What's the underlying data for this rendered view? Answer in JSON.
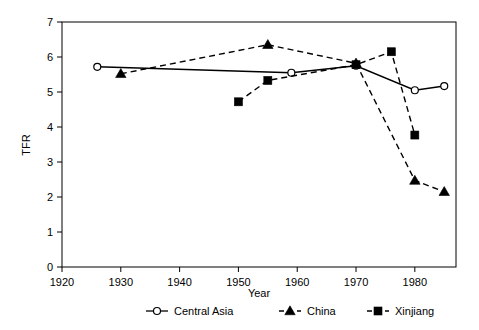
{
  "chart_data": {
    "type": "line",
    "title": "",
    "xlabel": "Year",
    "ylabel": "TFR",
    "xlim": [
      1920,
      1987
    ],
    "ylim": [
      0,
      7
    ],
    "xticks": [
      1920,
      1930,
      1940,
      1950,
      1960,
      1970,
      1980
    ],
    "yticks": [
      0,
      1,
      2,
      3,
      4,
      5,
      6,
      7
    ],
    "grid": false,
    "legend_position": "bottom",
    "series": [
      {
        "name": "Central Asia",
        "marker": "open-circle",
        "linestyle": "solid",
        "color": "#000000",
        "points": [
          {
            "x": 1926,
            "y": 5.72
          },
          {
            "x": 1959,
            "y": 5.55
          },
          {
            "x": 1970,
            "y": 5.75
          },
          {
            "x": 1980,
            "y": 5.05
          },
          {
            "x": 1985,
            "y": 5.17
          }
        ]
      },
      {
        "name": "China",
        "marker": "filled-triangle",
        "linestyle": "dashed",
        "color": "#000000",
        "points": [
          {
            "x": 1930,
            "y": 5.52
          },
          {
            "x": 1955,
            "y": 6.35
          },
          {
            "x": 1970,
            "y": 5.82
          },
          {
            "x": 1980,
            "y": 2.47
          },
          {
            "x": 1985,
            "y": 2.15
          }
        ]
      },
      {
        "name": "Xinjiang",
        "marker": "filled-square",
        "linestyle": "dashed",
        "color": "#000000",
        "points": [
          {
            "x": 1950,
            "y": 4.72
          },
          {
            "x": 1955,
            "y": 5.33
          },
          {
            "x": 1970,
            "y": 5.78
          },
          {
            "x": 1976,
            "y": 6.15
          },
          {
            "x": 1980,
            "y": 3.77
          }
        ]
      }
    ]
  },
  "axis": {
    "y_title": "TFR",
    "x_title": "Year",
    "x_tick_labels": [
      "1920",
      "1930",
      "1940",
      "1950",
      "1960",
      "1970",
      "1980"
    ],
    "y_tick_labels": [
      "0",
      "1",
      "2",
      "3",
      "4",
      "5",
      "6",
      "7"
    ]
  },
  "legend": {
    "items": [
      {
        "label": "Central Asia",
        "marker": "open-circle",
        "linestyle": "solid"
      },
      {
        "label": "China",
        "marker": "filled-triangle",
        "linestyle": "dashed"
      },
      {
        "label": "Xinjiang",
        "marker": "filled-square",
        "linestyle": "dashed"
      }
    ]
  }
}
